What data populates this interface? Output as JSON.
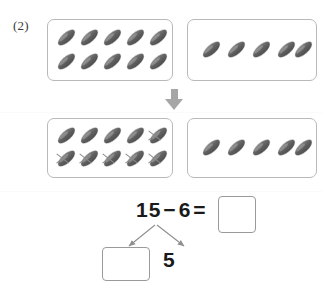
{
  "problem": {
    "number_label": "(2)"
  },
  "groups": {
    "top_left": {
      "name": "ten-frame-group",
      "count": 10,
      "rows": 2,
      "per_row": 5,
      "crossed_out": 0,
      "icon": "seed-icon"
    },
    "top_right": {
      "name": "ones-group",
      "count": 5,
      "rows": 1,
      "per_row": 5,
      "crossed_out": 0,
      "icon": "seed-icon"
    },
    "bottom_left": {
      "name": "ten-frame-group-crossed",
      "count": 10,
      "rows": 2,
      "per_row": 5,
      "crossed_out": 6,
      "crossed_indices": [
        4,
        5,
        6,
        7,
        8,
        9
      ],
      "icon": "seed-icon"
    },
    "bottom_right": {
      "name": "ones-group",
      "count": 5,
      "rows": 1,
      "per_row": 5,
      "crossed_out": 0,
      "icon": "seed-icon"
    }
  },
  "arrow": {
    "direction": "down",
    "icon": "arrow-down-icon",
    "color": "#a6a6a6"
  },
  "equation": {
    "minuend": "15",
    "operator": "−",
    "subtrahend": "6",
    "equals": "=",
    "result_value": ""
  },
  "decomposition": {
    "from": "15",
    "left_part_value": "",
    "right_part_value": "5",
    "arrow_color": "#8f8f8f"
  },
  "colors": {
    "seed_fill": "#616161",
    "box_border": "#b9b9b9",
    "answer_box_border": "#9a9a9a",
    "arrow_gray": "#a6a6a6",
    "text": "#1a1a1a",
    "page_background": "#ffffff"
  }
}
